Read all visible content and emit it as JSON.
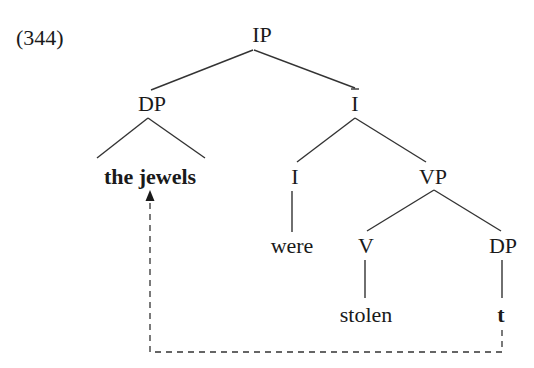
{
  "example_number": "(344)",
  "nodes": {
    "ip": "IP",
    "dp": "DP",
    "ibar": "I",
    "the_jewels": "the jewels",
    "i": "I",
    "vp": "VP",
    "were": "were",
    "v": "V",
    "dp2": "DP",
    "stolen": "stolen",
    "trace": "t"
  },
  "tree": {
    "label": "IP",
    "children": [
      {
        "label": "DP",
        "children": [
          {
            "label": "the jewels",
            "bold": true,
            "triangle": true
          }
        ]
      },
      {
        "label": "I-bar",
        "children": [
          {
            "label": "I",
            "children": [
              {
                "label": "were"
              }
            ]
          },
          {
            "label": "VP",
            "children": [
              {
                "label": "V",
                "children": [
                  {
                    "label": "stolen"
                  }
                ]
              },
              {
                "label": "DP",
                "children": [
                  {
                    "label": "t",
                    "bold": true
                  }
                ]
              }
            ]
          }
        ]
      }
    ]
  },
  "movement": {
    "from": "t",
    "to": "the jewels",
    "style": "dashed-arrow"
  }
}
